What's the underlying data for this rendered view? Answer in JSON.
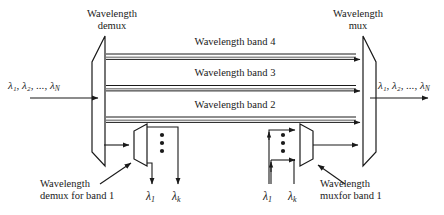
{
  "figure": {
    "type": "optical-network-band-mux-demux-diagram",
    "background_color": "#ffffff",
    "line_color": "#1a1a1a",
    "text_color": "#1a1a1a"
  },
  "headings": {
    "demux_line1": "Wavelength",
    "demux_line2": "demux",
    "mux_line1": "Wavelength",
    "mux_line2": "mux"
  },
  "bands": [
    {
      "label": "Wavelength band 4"
    },
    {
      "label": "Wavelength band 3"
    },
    {
      "label": "Wavelength band 2"
    }
  ],
  "ports": {
    "input_lambda": "λ₁, λ₂, ..., λ",
    "input_lambda_sub": "N",
    "output_lambda": "λ₁, λ₂, ..., λ",
    "output_lambda_sub": "N"
  },
  "captions": {
    "demux_band1_line1": "Wavelength",
    "demux_band1_line2": "demux for band 1",
    "mux_band1_line1": "Wavelength",
    "mux_band1_line2": "muxfor band 1"
  },
  "sub_demux_outputs": [
    {
      "symbol": "λ",
      "sub": "1"
    },
    {
      "symbol": "λ",
      "sub": "k"
    }
  ],
  "sub_mux_inputs": [
    {
      "symbol": "λ",
      "sub": "1"
    },
    {
      "symbol": "λ",
      "sub": "k"
    }
  ],
  "vertical_ellipsis": "⋮"
}
